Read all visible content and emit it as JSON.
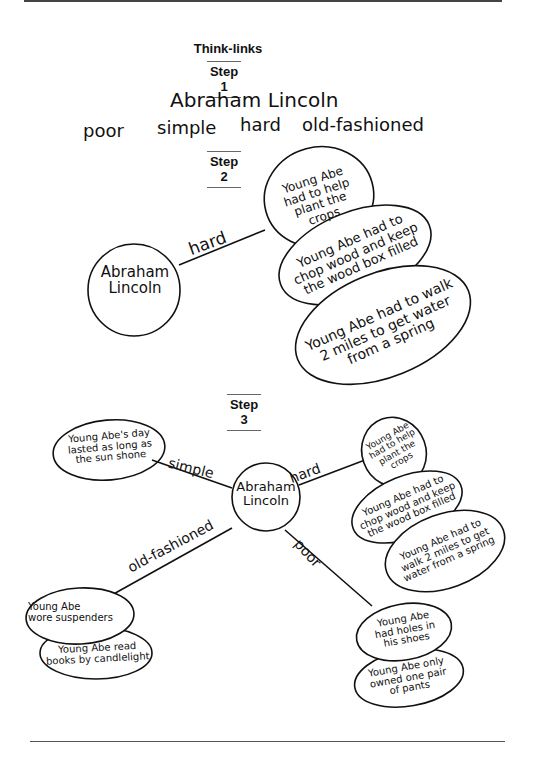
{
  "title": "Think-links",
  "step1": {
    "label": "Step 1",
    "topic": "Abraham Lincoln",
    "words": [
      "poor",
      "simple",
      "hard",
      "old-fashioned"
    ]
  },
  "step2": {
    "label": "Step 2",
    "center": "Abraham\nLincoln",
    "link_label": "hard",
    "details": [
      "Young Abe\nhad to help\nplant the\ncrops",
      "Young Abe had to\nchop wood and keep\nthe wood box filled",
      "Young Abe had to walk\n2 miles to get water\nfrom a spring"
    ]
  },
  "step3": {
    "label": "Step 3",
    "center": "Abraham\nLincoln",
    "branches": {
      "simple": {
        "label": "simple",
        "details": [
          "Young Abe's day\nlasted as long as\nthe sun shone"
        ]
      },
      "hard": {
        "label": "hard",
        "details": [
          "Young Abe\nhad to help\nplant the\ncrops",
          "Young Abe had to\nchop wood and keep\nthe wood box filled",
          "Young Abe had to\nwalk 2 miles to get\nwater from a spring"
        ]
      },
      "old_fashioned": {
        "label": "old-fashioned",
        "details": [
          "Young Abe\nwore suspenders",
          "Young Abe read\nbooks by candlelight"
        ]
      },
      "poor": {
        "label": "poor",
        "details": [
          "Young Abe\nhad holes in\nhis shoes",
          "Young Abe only\nowned one pair\nof pants"
        ]
      }
    }
  }
}
